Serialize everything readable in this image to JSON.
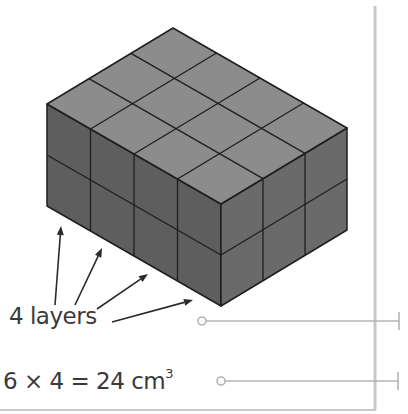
{
  "diagram": {
    "cubes_along_left_face": 4,
    "cubes_along_right_face": 3,
    "layers_shown": 2,
    "colors": {
      "top_face": "#8c8c8c",
      "left_face": "#5e5e5e",
      "right_face": "#6a6a6a",
      "edge": "#1e1e1e",
      "leader_line": "#b4b4b4",
      "margin_rule": "#c8c8c8",
      "arrow": "#2a2a2a"
    }
  },
  "annotations": {
    "layers_label": "4 layers",
    "arrows_count": 4,
    "equation": {
      "text": "6 × 4 = 24 cm",
      "superscript": "3"
    }
  },
  "leader_lines": [
    {
      "name": "leader-layers",
      "start_x": 202,
      "y": 321,
      "end_x": 399
    },
    {
      "name": "leader-equation",
      "start_x": 221,
      "y": 381,
      "end_x": 398
    }
  ]
}
